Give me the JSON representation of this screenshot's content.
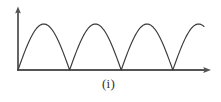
{
  "figure": {
    "caption": "(i)",
    "background_color": "#ffffff",
    "axis_color": "#555555",
    "curve_color": "#3a3a3a"
  },
  "axes": {
    "y_axis_name": "vertical-axis",
    "x_axis_name": "horizontal-axis",
    "origin_x": 18,
    "origin_y": 70,
    "y_axis_top": 7,
    "x_axis_right": 211,
    "arrowheads": "both",
    "tick_labels_x": [],
    "tick_labels_y": [],
    "xlabel": "",
    "ylabel": ""
  },
  "chart_data": {
    "type": "line",
    "title": "",
    "subtitle": "",
    "xlabel": "",
    "ylabel": "",
    "legend": [],
    "legend_position": "none",
    "grid": false,
    "waveform": "full-wave rectified sine",
    "amplitude": 46,
    "period": 51.6,
    "baseline_y": 70,
    "peak_y": 24,
    "zero_crossings_x": [
      18,
      69.6,
      121.2,
      172.8
    ],
    "peaks_x": [
      43.8,
      95.4,
      147.0,
      198.6
    ],
    "curve_start_x": 18,
    "curve_end_x": 204,
    "xlim": [
      18,
      211
    ],
    "ylim": [
      0,
      46
    ],
    "samples_per_arc": 48,
    "arcs": [
      {
        "index": 1,
        "start_x": 18,
        "end_x": 69.6,
        "peak_x": 43.8,
        "complete": true
      },
      {
        "index": 2,
        "start_x": 69.6,
        "end_x": 121.2,
        "peak_x": 95.4,
        "complete": true
      },
      {
        "index": 3,
        "start_x": 121.2,
        "end_x": 172.8,
        "peak_x": 147.0,
        "complete": true
      },
      {
        "index": 4,
        "start_x": 172.8,
        "end_x": 204,
        "peak_x": 198.6,
        "complete": false
      }
    ]
  }
}
